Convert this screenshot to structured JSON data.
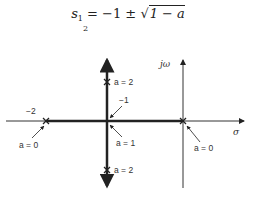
{
  "formula": {
    "lhs": "s",
    "sub_top": "1",
    "sub_bottom": "2",
    "equals": "=",
    "rhs_prefix": "−1 ± √",
    "radicand": "1 − a",
    "full_text": "s₁,₂ = −1 ± √(1 − a)"
  },
  "diagram": {
    "axis_labels": {
      "imaginary": "jω",
      "real": "σ"
    },
    "point_labels": {
      "minus_two": "−2",
      "minus_one": "−1"
    },
    "annotations": [
      {
        "id": "left_pole_a0",
        "text": "a = 0"
      },
      {
        "id": "center_a1",
        "text": "a = 1"
      },
      {
        "id": "right_pole_a0",
        "text": "a = 0"
      },
      {
        "id": "top_a2",
        "text": "a = 2"
      },
      {
        "id": "bottom_a2",
        "text": "a = 2"
      }
    ]
  }
}
